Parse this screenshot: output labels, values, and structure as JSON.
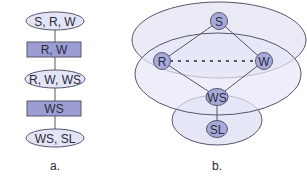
{
  "colors": {
    "ellipse_fill": "#e3e4f5",
    "rect_fill": "#9c9ed3",
    "node_fill": "#a8aadb",
    "region_fill": "#e6e7f6",
    "stroke": "#55566a",
    "text": "#2a2a3a"
  },
  "diagram_a": {
    "caption": "a.",
    "cliques": [
      {
        "label": "S, R, W"
      },
      {
        "label": "R, W, WS"
      },
      {
        "label": "WS, SL"
      }
    ],
    "separators": [
      {
        "label": "R, W"
      },
      {
        "label": "WS"
      }
    ]
  },
  "diagram_b": {
    "caption": "b.",
    "nodes": [
      {
        "id": "S",
        "label": "S"
      },
      {
        "id": "R",
        "label": "R"
      },
      {
        "id": "W",
        "label": "W"
      },
      {
        "id": "WS",
        "label": "WS"
      },
      {
        "id": "SL",
        "label": "SL"
      }
    ],
    "edges": [
      {
        "from": "S",
        "to": "R",
        "style": "solid"
      },
      {
        "from": "S",
        "to": "W",
        "style": "solid"
      },
      {
        "from": "R",
        "to": "WS",
        "style": "solid"
      },
      {
        "from": "W",
        "to": "WS",
        "style": "solid"
      },
      {
        "from": "R",
        "to": "W",
        "style": "dashed"
      },
      {
        "from": "WS",
        "to": "SL",
        "style": "solid"
      }
    ],
    "regions": [
      "S-R-W clique",
      "R-W-WS clique",
      "WS-SL clique"
    ]
  }
}
